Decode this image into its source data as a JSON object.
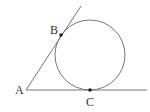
{
  "diagram": {
    "type": "geometry",
    "stroke_color": "#555555",
    "point_color": "#222222",
    "points": {
      "A": {
        "label": "A",
        "x": 26,
        "y": 90
      },
      "B": {
        "label": "B",
        "x": 61,
        "y": 35
      },
      "C": {
        "label": "C",
        "x": 90,
        "y": 90
      }
    },
    "circle": {
      "cx": 90,
      "cy": 55,
      "r": 35
    },
    "lines": [
      {
        "from": "A",
        "to_x": 147,
        "to_y": 90
      },
      {
        "from": "A",
        "to_x": 81,
        "to_y": 6
      }
    ]
  }
}
